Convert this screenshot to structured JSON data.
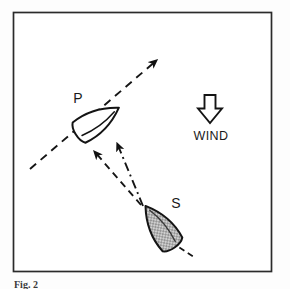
{
  "figure": {
    "caption": "Fig. 2",
    "frame": {
      "x": 13,
      "y": 12,
      "width": 259,
      "height": 260,
      "stroke_color": "#2b2b2b",
      "background_color": "#ffffff"
    }
  },
  "labels": {
    "port_boat": "P",
    "starboard_boat": "S",
    "wind": "WIND"
  },
  "colors": {
    "ink": "#1a1a1a",
    "hatch_fill": "#b9b9b9",
    "hull_fill": "#ffffff",
    "frame": "#2b2b2b"
  },
  "diagram_data": {
    "type": "diagram",
    "subject": "sailing right-of-way: port tack and starboard tack boats converging",
    "wind_direction": "from top to bottom",
    "boats": [
      {
        "id": "P",
        "name": "port-tack-boat",
        "fill": "white",
        "heading": "up-right",
        "heading_degrees": 30,
        "center": [
          96,
          122
        ],
        "label_position": [
          78,
          98
        ]
      },
      {
        "id": "S",
        "name": "starboard-tack-boat",
        "fill": "hatched-gray",
        "heading": "up-left",
        "heading_degrees": 125,
        "center": [
          160,
          228
        ],
        "label_position": [
          175,
          203
        ]
      }
    ],
    "course_lines": [
      {
        "name": "port-boat-course",
        "style": "dashed",
        "from": [
          30,
          168
        ],
        "to": [
          160,
          58
        ],
        "arrowhead_at": "to"
      },
      {
        "name": "starboard-boat-course-left",
        "style": "dashed",
        "from": [
          143,
          207
        ],
        "to": [
          92,
          148
        ],
        "arrowhead_at": "to"
      },
      {
        "name": "starboard-boat-course-right",
        "style": "dash-dot",
        "from": [
          143,
          207
        ],
        "to": [
          115,
          140
        ],
        "arrowhead_at": "to"
      },
      {
        "name": "starboard-boat-stern-line",
        "style": "dashed",
        "from": [
          172,
          243
        ],
        "to": [
          192,
          256
        ],
        "arrowhead_at": "none"
      }
    ],
    "wind_arrow": {
      "name": "wind-arrow",
      "shape": "hollow-block-arrow",
      "direction": "down",
      "position": [
        210,
        108
      ]
    }
  }
}
